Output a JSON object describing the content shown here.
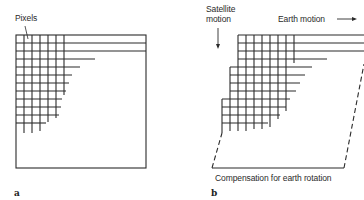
{
  "panels": {
    "a": {
      "letter": "a",
      "callout_label": "Pixels"
    },
    "b": {
      "letter": "b",
      "satellite_motion_line1": "Satellite",
      "satellite_motion_line2": "motion",
      "earth_motion_label": "Earth motion",
      "compensation_label": "Compensation for earth rotation"
    }
  },
  "colors": {
    "line": "#2b2b2b",
    "background": "#ffffff"
  }
}
